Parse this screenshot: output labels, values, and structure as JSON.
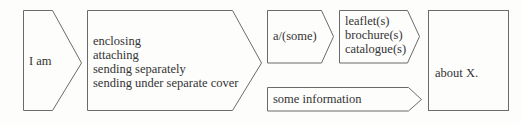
{
  "diagram": {
    "stroke_color": "#6b6b6b",
    "background": "#fdfdfc",
    "boxes": [
      {
        "id": "subject",
        "lines": [
          "I am"
        ]
      },
      {
        "id": "verb",
        "lines": [
          "enclosing",
          "attaching",
          "sending separately",
          "sending under separate cover"
        ]
      },
      {
        "id": "article",
        "lines": [
          "a/(some)"
        ]
      },
      {
        "id": "items",
        "lines": [
          "leaflet(s)",
          "brochure(s)",
          "catalogue(s)"
        ]
      },
      {
        "id": "info",
        "lines": [
          "some information"
        ]
      },
      {
        "id": "topic",
        "lines": [
          "about X."
        ]
      }
    ]
  }
}
